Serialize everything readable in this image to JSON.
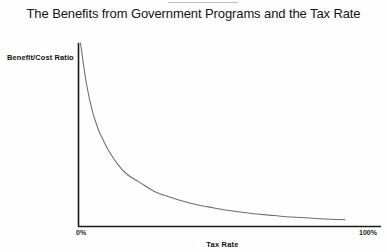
{
  "chart_data": {
    "type": "line",
    "title": "The Benefits from Government Programs and the Tax Rate",
    "xlabel": "Tax Rate",
    "ylabel": "Benefit/Cost Ratio",
    "xlim": [
      0,
      100
    ],
    "ylim": [
      0,
      100
    ],
    "grid": false,
    "legend": null,
    "x_tick_labels": [
      "0%",
      "100%"
    ],
    "x_tick_values": [
      0,
      100
    ],
    "y_tick_labels": [],
    "axis_color": "#1a1a1a",
    "curve_color": "#6d6d6d",
    "series": [
      {
        "name": "Benefit/Cost Ratio",
        "x": [
          0,
          2,
          4,
          6,
          8,
          10,
          13,
          16,
          20,
          25,
          30,
          35,
          40,
          45,
          50,
          55,
          60,
          65,
          70,
          75,
          80,
          85,
          90
        ],
        "values": [
          100,
          78,
          63,
          53,
          46,
          40,
          33,
          28,
          24,
          19,
          16,
          13.5,
          11.5,
          10,
          8.6,
          7.5,
          6.6,
          5.8,
          5.1,
          4.6,
          4.1,
          3.7,
          3.4
        ]
      }
    ]
  },
  "figure": {
    "title": "The Benefits from Government Programs and the Tax Rate",
    "ylabel": "Benefit/Cost Ratio",
    "xlabel": "Tax Rate",
    "tick_min": "0%",
    "tick_max": "100%"
  }
}
